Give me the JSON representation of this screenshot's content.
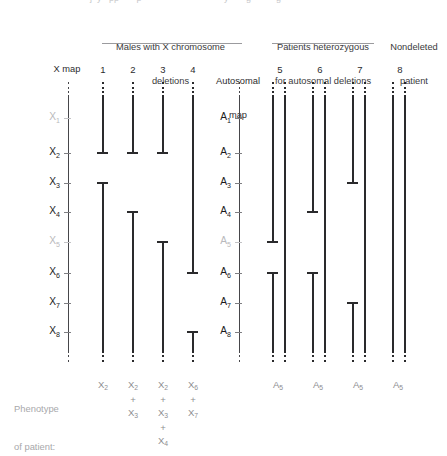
{
  "figure": {
    "title_fragment_top": "",
    "groups": [
      {
        "name": "males-x-deletions",
        "line1": "Males with X chromosome",
        "line2": "deletions"
      },
      {
        "name": "patients-heterozygous",
        "line1": "Patients heterozygous",
        "line2": "for autosomal deletions"
      },
      {
        "name": "nondeleted",
        "line1": "Nondeleted",
        "line2": "patient"
      }
    ],
    "maps": [
      {
        "id": "x-map",
        "label": "X map",
        "prefix": "X"
      },
      {
        "id": "autosomal-map",
        "label_line1": "Autosomal",
        "label_line2": "map",
        "prefix": "A"
      }
    ],
    "x_loci": [
      {
        "label": "X",
        "sub": "1",
        "dim": true
      },
      {
        "label": "X",
        "sub": "2",
        "dim": false
      },
      {
        "label": "X",
        "sub": "3",
        "dim": false
      },
      {
        "label": "X",
        "sub": "4",
        "dim": false
      },
      {
        "label": "X",
        "sub": "5",
        "dim": true
      },
      {
        "label": "X",
        "sub": "6",
        "dim": false
      },
      {
        "label": "X",
        "sub": "7",
        "dim": false
      },
      {
        "label": "X",
        "sub": "8",
        "dim": false
      }
    ],
    "a_loci": [
      {
        "label": "A",
        "sub": "1",
        "dim": false
      },
      {
        "label": "A",
        "sub": "2",
        "dim": false
      },
      {
        "label": "A",
        "sub": "3",
        "dim": false
      },
      {
        "label": "A",
        "sub": "4",
        "dim": false
      },
      {
        "label": "A",
        "sub": "5",
        "dim": true
      },
      {
        "label": "A",
        "sub": "6",
        "dim": false
      },
      {
        "label": "A",
        "sub": "7",
        "dim": false
      },
      {
        "label": "A",
        "sub": "8",
        "dim": false
      }
    ],
    "columns": [
      {
        "id": "patient-1",
        "number": "1",
        "group": "males-x-deletions",
        "chromatids": 1,
        "deleted_chromatid": {
          "gap_from": "X2",
          "gap_to": "X3"
        }
      },
      {
        "id": "patient-2",
        "number": "2",
        "group": "males-x-deletions",
        "chromatids": 1,
        "deleted_chromatid": {
          "gap_from": "X2",
          "gap_to": "X4"
        }
      },
      {
        "id": "patient-3",
        "number": "3",
        "group": "males-x-deletions",
        "chromatids": 1,
        "deleted_chromatid": {
          "gap_from": "X2",
          "gap_to": "X5"
        }
      },
      {
        "id": "patient-4",
        "number": "4",
        "group": "males-x-deletions",
        "chromatids": 1,
        "deleted_chromatid": {
          "gap_from": "X6",
          "gap_to": "X8"
        }
      },
      {
        "id": "patient-5",
        "number": "5",
        "group": "patients-heterozygous",
        "chromatids": 2,
        "deleted_chromatid": {
          "gap_from": "A5",
          "gap_to": "A6"
        }
      },
      {
        "id": "patient-6",
        "number": "6",
        "group": "patients-heterozygous",
        "chromatids": 2,
        "deleted_chromatid": {
          "gap_from": "A4",
          "gap_to": "A6"
        }
      },
      {
        "id": "patient-7",
        "number": "7",
        "group": "patients-heterozygous",
        "chromatids": 2,
        "deleted_chromatid": {
          "gap_from": "A3",
          "gap_to": "A7"
        }
      },
      {
        "id": "patient-8",
        "number": "8",
        "group": "nondeleted",
        "chromatids": 2,
        "deleted_chromatid": null
      }
    ],
    "phenotype": {
      "line1": "Phenotype",
      "line2": "of patient:"
    },
    "phenotypes": [
      {
        "column": "1",
        "terms": [
          "X2"
        ]
      },
      {
        "column": "2",
        "terms": [
          "X2",
          "+",
          "X3"
        ]
      },
      {
        "column": "3",
        "terms": [
          "X2",
          "+",
          "X3",
          "+",
          "X4"
        ]
      },
      {
        "column": "4",
        "terms": [
          "X6",
          "+",
          "X7"
        ]
      },
      {
        "column": "5",
        "terms": [
          "A5"
        ]
      },
      {
        "column": "6",
        "terms": [
          "A5"
        ]
      },
      {
        "column": "7",
        "terms": [
          "A5"
        ]
      },
      {
        "column": "8",
        "terms": [
          "A5"
        ]
      }
    ],
    "colors": {
      "background": "#ffffff",
      "bar": "#2a2a2c",
      "axis": "#46464a",
      "label": "#1b1b1d",
      "label_dim": "#b9b9bc",
      "header": "#3a3a3c",
      "rule": "#9b9b9e",
      "phenotype_text": "#8e8e91"
    }
  }
}
